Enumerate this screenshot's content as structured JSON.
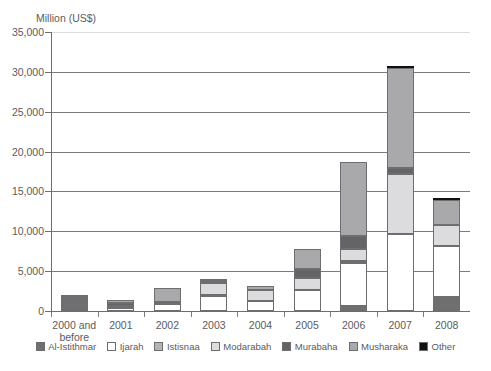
{
  "chart_data": {
    "type": "bar",
    "subtype": "stacked-vertical",
    "title": "",
    "ylabel": "Million (US$)",
    "xlabel": "",
    "ylim": [
      0,
      35000
    ],
    "ytick_labels": [
      "0",
      "5,000",
      "10,000",
      "15,000",
      "20,000",
      "25,000",
      "30,000",
      "35,000"
    ],
    "ytick_values": [
      0,
      5000,
      10000,
      15000,
      20000,
      25000,
      30000,
      35000
    ],
    "grid": "horizontal",
    "legend_position": "bottom",
    "categories": [
      "2000 and\nbefore",
      "2001",
      "2002",
      "2003",
      "2004",
      "2005",
      "2006",
      "2007",
      "2008"
    ],
    "series": [
      {
        "name": "Al-Istithmar",
        "color": "#6f6f71",
        "values": [
          2070,
          0,
          0,
          0,
          0,
          0,
          600,
          0,
          1700
        ]
      },
      {
        "name": "Ijarah",
        "color": "#ffffff",
        "values": [
          0,
          340,
          850,
          1900,
          1250,
          2600,
          5400,
          9650,
          6400
        ]
      },
      {
        "name": "Istisnaa",
        "color": "#b4b4b6",
        "values": [
          0,
          0,
          0,
          150,
          0,
          0,
          300,
          0,
          0
        ]
      },
      {
        "name": "Modarabah",
        "color": "#dcdcde",
        "values": [
          0,
          320,
          0,
          1450,
          1400,
          1600,
          1500,
          7500,
          2700
        ]
      },
      {
        "name": "Murabaha",
        "color": "#646466",
        "values": [
          0,
          400,
          280,
          280,
          0,
          1100,
          1550,
          750,
          0
        ]
      },
      {
        "name": "Musharaka",
        "color": "#a9a9ab",
        "values": [
          0,
          330,
          1790,
          280,
          550,
          2500,
          9350,
          12550,
          3100
        ]
      },
      {
        "name": "Other",
        "color": "#111111",
        "values": [
          0,
          0,
          0,
          0,
          0,
          0,
          0,
          350,
          200
        ]
      }
    ],
    "totals": [
      2070,
      1390,
      2920,
      4060,
      3200,
      7800,
      18700,
      30800,
      14100
    ]
  },
  "legend": {
    "items": [
      {
        "label": "Al-Istithmar",
        "swatch": "legend-swatch-al-istithmar"
      },
      {
        "label": "Ijarah",
        "swatch": "legend-swatch-ijarah"
      },
      {
        "label": "Istisnaa",
        "swatch": "legend-swatch-istisnaa"
      },
      {
        "label": "Modarabah",
        "swatch": "legend-swatch-modarabah"
      },
      {
        "label": "Murabaha",
        "swatch": "legend-swatch-murabaha"
      },
      {
        "label": "Musharaka",
        "swatch": "legend-swatch-musharaka"
      },
      {
        "label": "Other",
        "swatch": "legend-swatch-other"
      }
    ]
  }
}
